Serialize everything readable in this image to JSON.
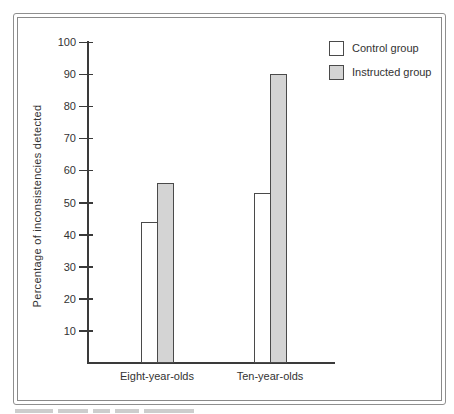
{
  "chart_data": {
    "type": "bar",
    "title": "",
    "categories": [
      "Eight-year-olds",
      "Ten-year-olds"
    ],
    "series": [
      {
        "name": "Control group",
        "values": [
          44,
          53
        ],
        "fill": "#ffffff"
      },
      {
        "name": "Instructed group",
        "values": [
          56,
          90
        ],
        "fill": "#d4d4d4"
      }
    ],
    "xlabel": "",
    "ylabel": "Percentage of inconsistencies detected",
    "ylim": [
      0,
      100
    ],
    "yticks": [
      10,
      20,
      30,
      40,
      50,
      60,
      70,
      80,
      90,
      100
    ],
    "grid": false,
    "legend_position": "top-right",
    "bar_border_color": "#4a4a4a",
    "axis_color": "#3a3a3a"
  }
}
